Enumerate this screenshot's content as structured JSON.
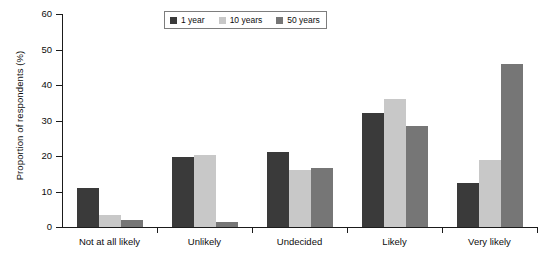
{
  "chart_data": {
    "type": "bar",
    "title": "",
    "xlabel": "",
    "ylabel": "Proportion of respondents (%)",
    "categories": [
      "Not at all likely",
      "Unlikely",
      "Undecided",
      "Likely",
      "Very likely"
    ],
    "series": [
      {
        "name": "1 year",
        "color": "#3a3a3a",
        "values": [
          11.0,
          19.7,
          21.0,
          32.0,
          12.3
        ]
      },
      {
        "name": "10 years",
        "color": "#c8c8c8",
        "values": [
          3.5,
          20.3,
          16.0,
          36.0,
          19.0
        ]
      },
      {
        "name": "50 years",
        "color": "#767676",
        "values": [
          2.0,
          1.5,
          16.7,
          28.5,
          45.8
        ]
      }
    ],
    "ylim": [
      0,
      60
    ],
    "yticks": [
      0,
      10,
      20,
      30,
      40,
      50,
      60
    ],
    "ytick_labels": [
      "0",
      "10",
      "20",
      "30",
      "40",
      "50",
      "60"
    ],
    "grid": false,
    "legend_position": "top-center"
  },
  "axes": {
    "y_title": "Proportion of respondents (%)"
  }
}
